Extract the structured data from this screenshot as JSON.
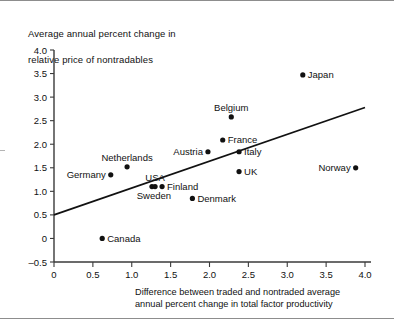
{
  "figure": {
    "title_lines": [
      "Average annual percent change in",
      "relative price of nontradables"
    ],
    "xaxis_caption_lines": [
      "Difference between traded and nontraded average",
      "annual percent change in total factor productivity"
    ]
  },
  "chart_data": {
    "type": "scatter",
    "title": "Average annual percent change in relative price of nontradables",
    "xlabel": "Difference between traded and nontraded average annual percent change in total factor productivity",
    "ylabel": "Average annual percent change in relative price of nontradables",
    "xlim": [
      0,
      4.0
    ],
    "ylim": [
      -0.5,
      4.0
    ],
    "xticks": [
      "0",
      "0.5",
      "1.0",
      "1.5",
      "2.0",
      "2.5",
      "3.0",
      "3.5",
      "4.0"
    ],
    "xtick_values": [
      0,
      0.5,
      1.0,
      1.5,
      2.0,
      2.5,
      3.0,
      3.5,
      4.0
    ],
    "yticks": [
      "-0.5",
      "0",
      "0.5",
      "1.0",
      "1.5",
      "2.0",
      "2.5",
      "3.0",
      "3.5",
      "4.0"
    ],
    "ytick_values": [
      -0.5,
      0,
      0.5,
      1.0,
      1.5,
      2.0,
      2.5,
      3.0,
      3.5,
      4.0
    ],
    "grid": false,
    "legend": "none",
    "marker_color": "#111111",
    "line_color": "#111111",
    "points": [
      {
        "label": "Canada",
        "x": 0.62,
        "y": 0.0,
        "label_pos": "right"
      },
      {
        "label": "Germany",
        "x": 0.73,
        "y": 1.35,
        "label_pos": "left"
      },
      {
        "label": "Netherlands",
        "x": 0.94,
        "y": 1.52,
        "label_pos": "above"
      },
      {
        "label": "Sweden",
        "x": 1.26,
        "y": 1.1,
        "label_pos": "below-left"
      },
      {
        "label": "USA",
        "x": 1.3,
        "y": 1.1,
        "label_pos": "above"
      },
      {
        "label": "Finland",
        "x": 1.39,
        "y": 1.1,
        "label_pos": "right"
      },
      {
        "label": "Denmark",
        "x": 1.78,
        "y": 0.85,
        "label_pos": "right"
      },
      {
        "label": "Austria",
        "x": 1.98,
        "y": 1.84,
        "label_pos": "left"
      },
      {
        "label": "France",
        "x": 2.17,
        "y": 2.09,
        "label_pos": "right"
      },
      {
        "label": "Belgium",
        "x": 2.28,
        "y": 2.58,
        "label_pos": "above"
      },
      {
        "label": "Italy",
        "x": 2.38,
        "y": 1.84,
        "label_pos": "right"
      },
      {
        "label": "UK",
        "x": 2.38,
        "y": 1.42,
        "label_pos": "right"
      },
      {
        "label": "Japan",
        "x": 3.2,
        "y": 3.47,
        "label_pos": "right"
      },
      {
        "label": "Norway",
        "x": 3.88,
        "y": 1.5,
        "label_pos": "left"
      }
    ],
    "fit_line": {
      "x_start": 0.0,
      "y_start": 0.5,
      "x_end": 4.0,
      "y_end": 2.78
    }
  }
}
